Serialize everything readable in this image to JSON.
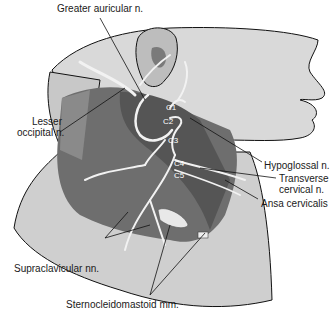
{
  "figure": {
    "type": "anatomical illustration",
    "colors": {
      "skin_light": "#d9d9d9",
      "skin_mid": "#bdbdbd",
      "muscle_dark": "#6e6e6e",
      "muscle_darker": "#555555",
      "nerve": "#f2f2f2",
      "outline": "#111111"
    }
  },
  "labels": {
    "greater_auricular": "Greater auricular n.",
    "lesser_occipital_1": "Lesser",
    "lesser_occipital_2": "occipital n.",
    "hypoglossal": "Hypoglossal n.",
    "transverse_cervical_1": "Transverse",
    "transverse_cervical_2": "cervical n.",
    "ansa_cervicalis": "Ansa cervicalis",
    "supraclavicular": "Supraclavicular nn.",
    "sternocleidomastoid": "Sternocleidomastoid mm."
  },
  "roots": [
    "C1",
    "C2",
    "C3",
    "C4",
    "C5"
  ]
}
